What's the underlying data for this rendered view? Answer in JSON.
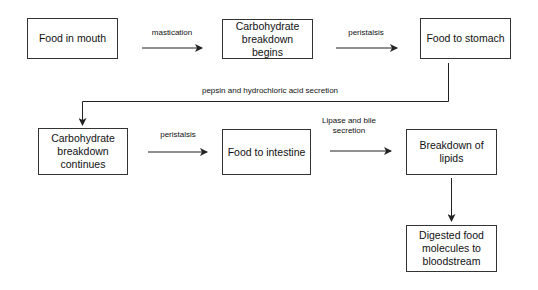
{
  "diagram": {
    "type": "flowchart",
    "nodes": [
      {
        "id": "n1",
        "label": "Food in mouth"
      },
      {
        "id": "n2",
        "label": "Carbohydrate breakdown begins"
      },
      {
        "id": "n3",
        "label": "Food to stomach"
      },
      {
        "id": "n4",
        "label": "Carbohydrate breakdown continues"
      },
      {
        "id": "n5",
        "label": "Food to intestine"
      },
      {
        "id": "n6",
        "label": "Breakdown of lipids"
      },
      {
        "id": "n7",
        "label": "Digested food molecules to bloodstream"
      }
    ],
    "edges": [
      {
        "from": "n1",
        "to": "n2",
        "label": "mastication"
      },
      {
        "from": "n2",
        "to": "n3",
        "label": "peristalsis"
      },
      {
        "from": "n3",
        "to": "n4",
        "label": "pepsin and hydrochloric acid secretion"
      },
      {
        "from": "n4",
        "to": "n5",
        "label": "peristalsis"
      },
      {
        "from": "n5",
        "to": "n6",
        "label": "Lipase and bile secretion"
      },
      {
        "from": "n6",
        "to": "n7",
        "label": ""
      }
    ],
    "colors": {
      "stroke": "#333333",
      "text": "#111111",
      "background": "#ffffff"
    }
  }
}
